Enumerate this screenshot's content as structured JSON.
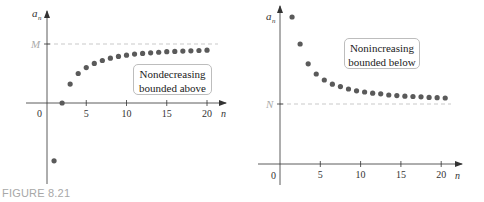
{
  "figure_caption": "FIGURE 8.21",
  "colors": {
    "point": "#5a5a5a",
    "axis": "#333333",
    "bound_line": "#bbbbbb",
    "caption": "#a8a8a8"
  },
  "chart_data": [
    {
      "type": "scatter",
      "title": "",
      "xlabel": "n",
      "ylabel": "a_n",
      "x_ticks": [
        "5",
        "10",
        "15",
        "20"
      ],
      "origin_label": "0",
      "bound_label": "M",
      "bound_type": "upper",
      "annotation": [
        "Nondecreasing",
        "bounded above"
      ],
      "x": [
        1,
        2,
        3,
        4,
        5,
        6,
        7,
        8,
        9,
        10,
        11,
        12,
        13,
        14,
        15,
        16,
        17,
        18,
        19,
        20
      ],
      "values": [
        -0.98,
        0.0,
        0.32,
        0.5,
        0.6,
        0.67,
        0.72,
        0.76,
        0.79,
        0.81,
        0.83,
        0.84,
        0.85,
        0.86,
        0.87,
        0.875,
        0.88,
        0.885,
        0.89,
        0.895
      ],
      "bound_value": 1.0,
      "grid": false
    },
    {
      "type": "scatter",
      "title": "",
      "xlabel": "n",
      "ylabel": "a_n",
      "x_ticks": [
        "5",
        "10",
        "15",
        "20"
      ],
      "origin_label": "0",
      "bound_label": "N",
      "bound_type": "lower",
      "annotation": [
        "Nonincreasing",
        "bounded below"
      ],
      "x": [
        1,
        2,
        3,
        4,
        5,
        6,
        7,
        8,
        9,
        10,
        11,
        12,
        13,
        14,
        15,
        16,
        17,
        18,
        19,
        20
      ],
      "values": [
        2.45,
        2.0,
        1.67,
        1.5,
        1.4,
        1.33,
        1.29,
        1.25,
        1.22,
        1.2,
        1.18,
        1.17,
        1.15,
        1.14,
        1.13,
        1.125,
        1.12,
        1.11,
        1.105,
        1.1
      ],
      "bound_value": 1.0,
      "grid": false
    }
  ]
}
